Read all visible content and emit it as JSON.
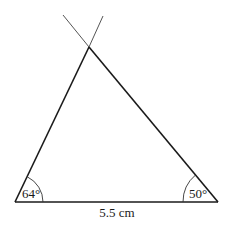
{
  "diagram": {
    "type": "triangle-construction",
    "base_label": "5.5 cm",
    "angles": {
      "left": "64°",
      "right": "50°"
    },
    "colors": {
      "line": "#1a1a1a",
      "construction_line": "#555555",
      "background": "#ffffff"
    },
    "vertices": {
      "bottom_left": [
        15,
        202
      ],
      "bottom_right": [
        218,
        202
      ],
      "apex": [
        89,
        47
      ]
    }
  }
}
